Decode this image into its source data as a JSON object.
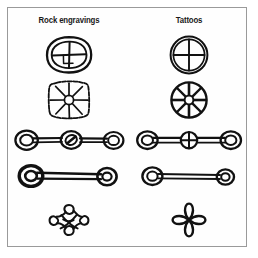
{
  "figure": {
    "name": "comparative-motif-plate",
    "background_color": "#ffffff",
    "frame_color": "#9a9a9a",
    "ink_color": "#111111",
    "columns": [
      {
        "id": "rock-engravings",
        "label": "Rock engravings"
      },
      {
        "id": "tattoos",
        "label": "Tattoos"
      }
    ],
    "rows": [
      {
        "id": "crossed-circle",
        "left": {
          "motif": "oval-with-cross",
          "style": "irregular-engraved",
          "description": "Rough double oval enclosing an off-centre cross"
        },
        "right": {
          "motif": "circle-with-cross",
          "style": "clean-linear",
          "description": "Double circle enclosing an even cross"
        }
      },
      {
        "id": "spoked-wheel",
        "left": {
          "motif": "spoked-disc",
          "style": "irregular-engraved",
          "spokes": 8,
          "description": "Squarish sketched disc with eight radiating spokes and small hub"
        },
        "right": {
          "motif": "spoked-wheel",
          "style": "clean-linear",
          "spokes": 8,
          "description": "Round wheel with eight thick spokes and small hub"
        }
      },
      {
        "id": "three-ring-bar",
        "left": {
          "motif": "bar-with-three-rings",
          "rings": 3,
          "center_fill": "diagonal-slash",
          "description": "Horizontal bar linking three rings, centre ring slashed"
        },
        "right": {
          "motif": "bar-with-three-rings",
          "rings": 3,
          "center_fill": "cross",
          "description": "Horizontal bar linking three rings, centre ring crossed"
        }
      },
      {
        "id": "two-ring-bar",
        "left": {
          "motif": "bar-with-two-rings",
          "rings": 2,
          "weight": "heavy",
          "description": "Thick bar linking two heavy concentric rings"
        },
        "right": {
          "motif": "bar-with-two-rings",
          "rings": 2,
          "weight": "light",
          "description": "Slender bar linking two light concentric rings"
        }
      },
      {
        "id": "quatrefoil-knot",
        "left": {
          "motif": "interlaced-quatrefoil-knot",
          "lobes": 4,
          "style": "interlaced",
          "description": "Four-lobed interlaced looping knot"
        },
        "right": {
          "motif": "quatrefoil-knot",
          "lobes": 4,
          "style": "simple",
          "description": "Four-lobed knot around a diamond centre"
        }
      }
    ]
  }
}
